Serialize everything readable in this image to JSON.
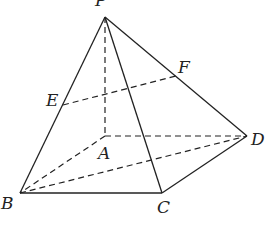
{
  "figure": {
    "type": "pyramid",
    "name": "P-ABCD",
    "points": {
      "P": {
        "label": "P",
        "x": 105,
        "y": 17
      },
      "A": {
        "label": "A",
        "x": 105,
        "y": 136
      },
      "B": {
        "label": "B",
        "x": 20,
        "y": 193
      },
      "C": {
        "label": "C",
        "x": 162,
        "y": 193
      },
      "D": {
        "label": "D",
        "x": 247,
        "y": 136
      },
      "E": {
        "label": "E",
        "x": 63,
        "y": 105
      },
      "F": {
        "label": "F",
        "x": 176,
        "y": 76
      }
    },
    "solid_edges": [
      "PB",
      "PC",
      "PD",
      "BC",
      "CD"
    ],
    "dashed_edges": [
      "PA",
      "AB",
      "AD",
      "BD",
      "EF"
    ]
  }
}
